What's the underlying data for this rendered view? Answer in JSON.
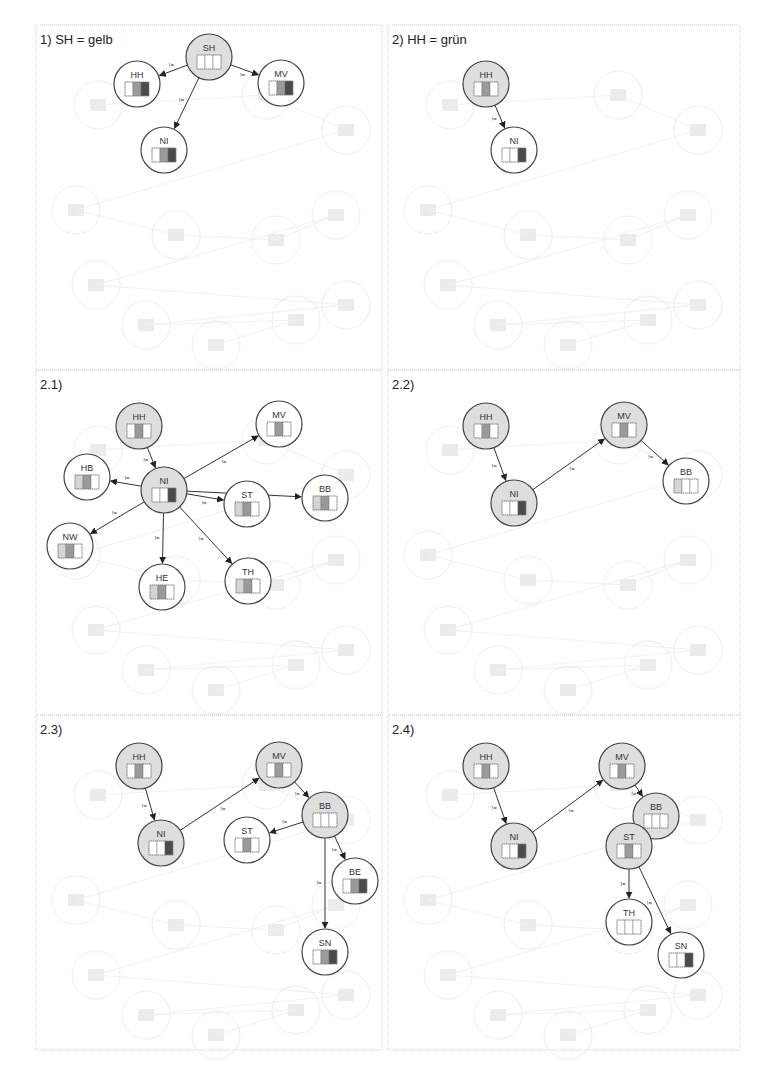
{
  "figure": {
    "colors": {
      "active_fill": "#dedede",
      "inactive_fill": "#ffffff",
      "shade_none": "#ffffff",
      "shade_light": "#d4d4d4",
      "shade_mid": "#9a9a9a",
      "shade_dark": "#4a4a4a",
      "edge": "#333333",
      "ghost": "#e9e9e9"
    },
    "edge_label": "!=",
    "panels": [
      {
        "id": "p1",
        "title": "1) SH = gelb",
        "nodes": [
          {
            "id": "SH",
            "label": "SH",
            "active": true,
            "bars": [
              "none",
              "none",
              "none"
            ]
          },
          {
            "id": "HH",
            "label": "HH",
            "active": false,
            "bars": [
              "none",
              "mid",
              "dark"
            ]
          },
          {
            "id": "MV",
            "label": "MV",
            "active": false,
            "bars": [
              "none",
              "mid",
              "dark"
            ]
          },
          {
            "id": "NI",
            "label": "NI",
            "active": false,
            "bars": [
              "none",
              "mid",
              "dark"
            ]
          }
        ],
        "edges": [
          {
            "from": "SH",
            "to": "HH",
            "label": "!="
          },
          {
            "from": "SH",
            "to": "MV",
            "label": "!="
          },
          {
            "from": "SH",
            "to": "NI",
            "label": "!="
          }
        ]
      },
      {
        "id": "p2",
        "title": "2) HH = grün",
        "nodes": [
          {
            "id": "HH",
            "label": "HH",
            "active": true,
            "bars": [
              "none",
              "mid",
              "none"
            ]
          },
          {
            "id": "NI",
            "label": "NI",
            "active": false,
            "bars": [
              "none",
              "none",
              "dark"
            ]
          }
        ],
        "edges": [
          {
            "from": "HH",
            "to": "NI",
            "label": "!="
          }
        ]
      },
      {
        "id": "p21",
        "title": "2.1)",
        "nodes": [
          {
            "id": "HH",
            "label": "HH",
            "active": true,
            "bars": [
              "none",
              "mid",
              "none"
            ]
          },
          {
            "id": "NI",
            "label": "NI",
            "active": true,
            "bars": [
              "none",
              "none",
              "dark"
            ]
          },
          {
            "id": "MV",
            "label": "MV",
            "active": false,
            "bars": [
              "none",
              "mid",
              "none"
            ]
          },
          {
            "id": "HB",
            "label": "HB",
            "active": false,
            "bars": [
              "light",
              "mid",
              "none"
            ]
          },
          {
            "id": "BB",
            "label": "BB",
            "active": false,
            "bars": [
              "light",
              "mid",
              "none"
            ]
          },
          {
            "id": "ST",
            "label": "ST",
            "active": false,
            "bars": [
              "light",
              "mid",
              "none"
            ]
          },
          {
            "id": "NW",
            "label": "NW",
            "active": false,
            "bars": [
              "light",
              "mid",
              "none"
            ]
          },
          {
            "id": "HE",
            "label": "HE",
            "active": false,
            "bars": [
              "light",
              "mid",
              "none"
            ]
          },
          {
            "id": "TH",
            "label": "TH",
            "active": false,
            "bars": [
              "light",
              "mid",
              "none"
            ]
          }
        ],
        "edges": [
          {
            "from": "HH",
            "to": "NI",
            "label": "!="
          },
          {
            "from": "NI",
            "to": "MV",
            "label": "!="
          },
          {
            "from": "NI",
            "to": "HB",
            "label": "!="
          },
          {
            "from": "NI",
            "to": "BB",
            "label": "!="
          },
          {
            "from": "NI",
            "to": "ST",
            "label": "!="
          },
          {
            "from": "NI",
            "to": "NW",
            "label": "!="
          },
          {
            "from": "NI",
            "to": "HE",
            "label": "!="
          },
          {
            "from": "NI",
            "to": "TH",
            "label": "!="
          }
        ]
      },
      {
        "id": "p22",
        "title": "2.2)",
        "nodes": [
          {
            "id": "HH",
            "label": "HH",
            "active": true,
            "bars": [
              "none",
              "mid",
              "none"
            ]
          },
          {
            "id": "NI",
            "label": "NI",
            "active": true,
            "bars": [
              "none",
              "none",
              "dark"
            ]
          },
          {
            "id": "MV",
            "label": "MV",
            "active": true,
            "bars": [
              "none",
              "mid",
              "none"
            ]
          },
          {
            "id": "BB",
            "label": "BB",
            "active": false,
            "bars": [
              "light",
              "none",
              "none"
            ]
          }
        ],
        "edges": [
          {
            "from": "HH",
            "to": "NI",
            "label": "!="
          },
          {
            "from": "NI",
            "to": "MV",
            "label": "!="
          },
          {
            "from": "MV",
            "to": "BB",
            "label": "!="
          }
        ]
      },
      {
        "id": "p23",
        "title": "2.3)",
        "nodes": [
          {
            "id": "HH",
            "label": "HH",
            "active": true,
            "bars": [
              "none",
              "mid",
              "none"
            ]
          },
          {
            "id": "NI",
            "label": "NI",
            "active": true,
            "bars": [
              "none",
              "none",
              "dark"
            ]
          },
          {
            "id": "MV",
            "label": "MV",
            "active": true,
            "bars": [
              "none",
              "mid",
              "none"
            ]
          },
          {
            "id": "BB",
            "label": "BB",
            "active": true,
            "bars": [
              "none",
              "none",
              "none"
            ]
          },
          {
            "id": "ST",
            "label": "ST",
            "active": false,
            "bars": [
              "none",
              "mid",
              "none"
            ]
          },
          {
            "id": "BE",
            "label": "BE",
            "active": false,
            "bars": [
              "none",
              "mid",
              "dark"
            ]
          },
          {
            "id": "SN",
            "label": "SN",
            "active": false,
            "bars": [
              "none",
              "mid",
              "dark"
            ]
          }
        ],
        "edges": [
          {
            "from": "HH",
            "to": "NI",
            "label": "!="
          },
          {
            "from": "NI",
            "to": "MV",
            "label": "!="
          },
          {
            "from": "MV",
            "to": "BB",
            "label": "!="
          },
          {
            "from": "BB",
            "to": "ST",
            "label": "!="
          },
          {
            "from": "BB",
            "to": "BE",
            "label": "!="
          },
          {
            "from": "BB",
            "to": "SN",
            "label": "!="
          }
        ]
      },
      {
        "id": "p24",
        "title": "2.4)",
        "nodes": [
          {
            "id": "HH",
            "label": "HH",
            "active": true,
            "bars": [
              "none",
              "mid",
              "none"
            ]
          },
          {
            "id": "NI",
            "label": "NI",
            "active": true,
            "bars": [
              "none",
              "none",
              "dark"
            ]
          },
          {
            "id": "MV",
            "label": "MV",
            "active": true,
            "bars": [
              "none",
              "mid",
              "none"
            ]
          },
          {
            "id": "BB",
            "label": "BB",
            "active": true,
            "bars": [
              "none",
              "none",
              "none"
            ]
          },
          {
            "id": "ST",
            "label": "ST",
            "active": true,
            "bars": [
              "none",
              "mid",
              "none"
            ]
          },
          {
            "id": "TH",
            "label": "TH",
            "active": false,
            "bars": [
              "none",
              "none",
              "none"
            ]
          },
          {
            "id": "SN",
            "label": "SN",
            "active": false,
            "bars": [
              "none",
              "none",
              "dark"
            ]
          }
        ],
        "edges": [
          {
            "from": "HH",
            "to": "NI",
            "label": "!="
          },
          {
            "from": "NI",
            "to": "MV",
            "label": "!="
          },
          {
            "from": "MV",
            "to": "BB",
            "label": "!="
          },
          {
            "from": "BB",
            "to": "ST",
            "label": "!="
          },
          {
            "from": "ST",
            "to": "TH",
            "label": "!="
          },
          {
            "from": "ST",
            "to": "SN",
            "label": "!="
          }
        ]
      }
    ]
  }
}
